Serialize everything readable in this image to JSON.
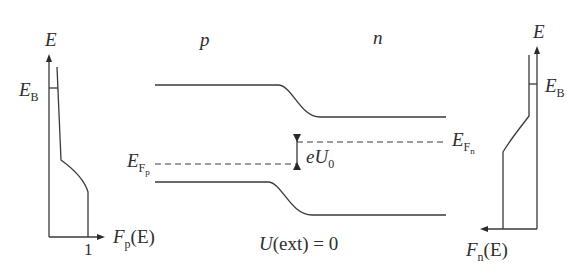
{
  "left_graph": {
    "axis_label": "E",
    "barrier_label": "E",
    "barrier_sub": "B",
    "x_axis_label": "F",
    "x_axis_sub": "p",
    "x_axis_paren": "(E)",
    "tick_one": "1"
  },
  "center": {
    "p_label": "p",
    "n_label": "n",
    "efp_label": "E",
    "efp_sub": "F",
    "efp_subsub": "p",
    "efn_label": "E",
    "efn_sub": "F",
    "efn_subsub": "n",
    "gap_label_e": "e",
    "gap_label_u": "U",
    "gap_label_sub": "0",
    "caption_u": "U",
    "caption_rest": "(ext) = 0"
  },
  "right_graph": {
    "axis_label": "E",
    "barrier_label": "E",
    "barrier_sub": "B",
    "x_axis_label": "F",
    "x_axis_sub": "n",
    "x_axis_paren": "(E)"
  },
  "colors": {
    "ink": "#3a3a3a",
    "background": "#ffffff"
  }
}
